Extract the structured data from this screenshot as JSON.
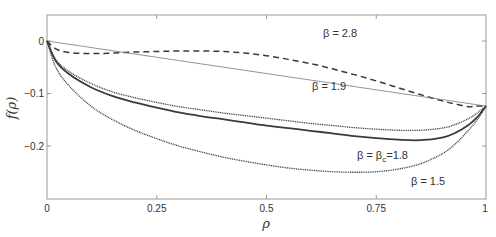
{
  "chart_data": {
    "type": "line",
    "title": "",
    "xlabel": "ρ",
    "ylabel": "f(ρ)",
    "xlim": [
      0,
      1
    ],
    "ylim": [
      -0.3,
      0.05
    ],
    "grid": false,
    "legend": "none (inline annotations)",
    "x_ticks": [
      0,
      0.25,
      0.5,
      0.75,
      1
    ],
    "x_tick_labels": [
      "0",
      "0.25",
      "0.5",
      "0.75",
      "1"
    ],
    "y_ticks": [
      0,
      -0.1,
      -0.2
    ],
    "y_tick_labels": [
      "0",
      "−0.1",
      "−0.2"
    ],
    "x": [
      0,
      0.02,
      0.05,
      0.1,
      0.15,
      0.2,
      0.25,
      0.3,
      0.35,
      0.4,
      0.45,
      0.5,
      0.55,
      0.6,
      0.65,
      0.7,
      0.75,
      0.8,
      0.85,
      0.9,
      0.93,
      0.96,
      0.98,
      1.0
    ],
    "series": [
      {
        "name": "β = 2.8",
        "style": "dashed",
        "values": [
          0,
          -0.015,
          -0.022,
          -0.024,
          -0.023,
          -0.021,
          -0.02,
          -0.019,
          -0.019,
          -0.02,
          -0.023,
          -0.028,
          -0.035,
          -0.043,
          -0.053,
          -0.064,
          -0.076,
          -0.089,
          -0.102,
          -0.114,
          -0.12,
          -0.125,
          -0.124,
          -0.124
        ]
      },
      {
        "name": "straight line (reference)",
        "style": "thin-solid",
        "values": [
          0,
          -0.0025,
          -0.0062,
          -0.0124,
          -0.0186,
          -0.0248,
          -0.031,
          -0.0372,
          -0.0434,
          -0.0496,
          -0.0558,
          -0.062,
          -0.0682,
          -0.0744,
          -0.0806,
          -0.0868,
          -0.093,
          -0.0992,
          -0.1054,
          -0.1116,
          -0.1153,
          -0.119,
          -0.1215,
          -0.124
        ]
      },
      {
        "name": "β = 1.9",
        "style": "dotted",
        "values": [
          0,
          -0.035,
          -0.058,
          -0.081,
          -0.097,
          -0.108,
          -0.117,
          -0.125,
          -0.131,
          -0.137,
          -0.142,
          -0.147,
          -0.152,
          -0.157,
          -0.161,
          -0.165,
          -0.168,
          -0.17,
          -0.17,
          -0.166,
          -0.159,
          -0.148,
          -0.137,
          -0.124
        ]
      },
      {
        "name": "β = β_c = 1.8",
        "style": "solid",
        "values": [
          0,
          -0.038,
          -0.063,
          -0.088,
          -0.105,
          -0.117,
          -0.127,
          -0.136,
          -0.143,
          -0.149,
          -0.155,
          -0.161,
          -0.166,
          -0.171,
          -0.176,
          -0.181,
          -0.185,
          -0.188,
          -0.189,
          -0.184,
          -0.175,
          -0.16,
          -0.145,
          -0.124
        ]
      },
      {
        "name": "β = 1.5",
        "style": "dotted",
        "values": [
          0,
          -0.05,
          -0.085,
          -0.124,
          -0.15,
          -0.17,
          -0.186,
          -0.2,
          -0.211,
          -0.221,
          -0.229,
          -0.236,
          -0.242,
          -0.246,
          -0.249,
          -0.25,
          -0.249,
          -0.244,
          -0.234,
          -0.215,
          -0.196,
          -0.17,
          -0.15,
          -0.124
        ]
      }
    ],
    "annotations": [
      {
        "text": "β = 2.8",
        "x": 0.63,
        "y": 0.01
      },
      {
        "text": "β = 1.9",
        "x": 0.61,
        "y": -0.088
      },
      {
        "text": "β = β_c=1.8",
        "x": 0.73,
        "y": -0.22
      },
      {
        "text": "β = 1.5",
        "x": 0.83,
        "y": -0.282
      }
    ]
  },
  "labels": {
    "xlabel": "ρ",
    "ylabel": "f(ρ)",
    "beta28": "β = 2.8",
    "beta19": "β = 1.9",
    "betac_prefix": "β = β",
    "betac_sub": "c",
    "betac_suffix": "=1.8",
    "beta15": "β = 1.5",
    "xt0": "0",
    "xt1": "0.25",
    "xt2": "0.5",
    "xt3": "0.75",
    "xt4": "1",
    "yt0": "0",
    "yt1": "−0.1",
    "yt2": "−0.2"
  },
  "colors": {
    "axis": "#9a9a9a",
    "curve": "#3a3a3a",
    "thin": "#777777"
  }
}
